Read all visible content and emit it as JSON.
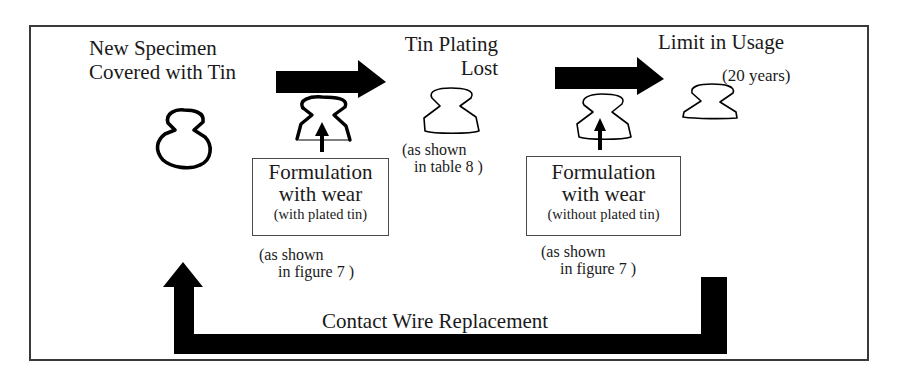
{
  "diagram": {
    "stages": [
      {
        "id": "new",
        "title_line1": "New Specimen",
        "title_line2": "Covered with Tin",
        "shape": "new-contact-wire-cross-section"
      },
      {
        "id": "lost",
        "title_line1": "Tin Plating",
        "title_line2": "Lost",
        "shape": "worn-contact-wire-cross-section",
        "note_line1": "(as shown",
        "note_line2": "in table 8 )"
      },
      {
        "id": "limit",
        "title_line1": "Limit in Usage",
        "subtitle": "(20 years)",
        "shape": "limit-contact-wire-cross-section"
      }
    ],
    "formulations": [
      {
        "id": "with-tin",
        "line1": "Formulation",
        "line2": "with wear",
        "sub": "(with plated tin)",
        "note_line1": "(as shown",
        "note_line2": "in figure 7 )"
      },
      {
        "id": "without-tin",
        "line1": "Formulation",
        "line2": "with wear",
        "sub": "(without plated tin)",
        "note_line1": "(as shown",
        "note_line2": "in figure 7 )"
      }
    ],
    "cycle": {
      "label": "Contact Wire Replacement"
    },
    "arrows": [
      "progress-arrow-1",
      "progress-arrow-2",
      "wear-arrow-1",
      "wear-arrow-2",
      "replacement-loop-arrow"
    ],
    "colors": {
      "ink": "#000000",
      "frame": "#3a3a3a",
      "text": "#1a1a1a",
      "background": "#ffffff"
    }
  }
}
